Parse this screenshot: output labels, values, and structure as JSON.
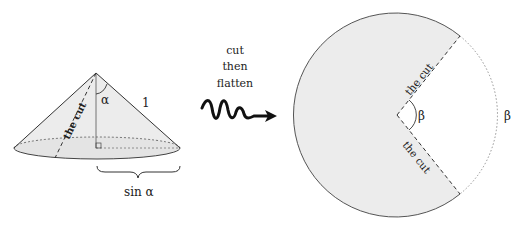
{
  "cone": {
    "cut_label": "the cut",
    "angle_label": "α",
    "slant_label": "1",
    "radius_label": "sin α"
  },
  "arrow": {
    "line1": "cut",
    "line2": "then",
    "line3": "flatten"
  },
  "disk": {
    "cut_label_top": "the cut",
    "cut_label_bottom": "the cut",
    "angle_label": "β",
    "arc_label": "β"
  },
  "colors": {
    "fill": "#ececec",
    "stroke": "#333333"
  }
}
